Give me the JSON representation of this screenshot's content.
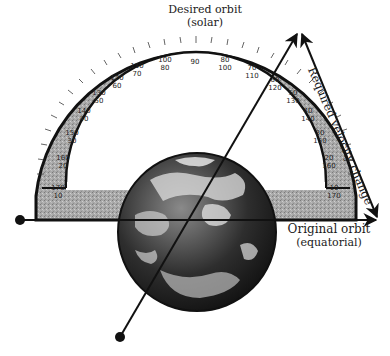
{
  "diagram": {
    "labels": {
      "desired_orbit": "Desired orbit",
      "desired_orbit_sub": "(solar)",
      "original_orbit": "Original orbit",
      "original_orbit_sub": "(equatorial)",
      "velocity_change": "Required velocity change"
    },
    "protractor": {
      "outer_scale": [
        "10",
        "20",
        "30",
        "40",
        "50",
        "60",
        "70",
        "80",
        "90",
        "100",
        "110",
        "120",
        "130",
        "140",
        "150",
        "160",
        "170"
      ],
      "inner_scale": [
        "170",
        "160",
        "150",
        "140",
        "130",
        "120",
        "110",
        "100",
        "90",
        "80",
        "70",
        "60",
        "50",
        "40",
        "30",
        "20",
        "10"
      ],
      "visible_pairs": [
        {
          "outer": "120",
          "inner": "60"
        },
        {
          "outer": "110",
          "inner": "70"
        },
        {
          "outer": "100",
          "inner": "80"
        },
        {
          "outer": "90",
          "inner": ""
        },
        {
          "outer": "80",
          "inner": "100"
        },
        {
          "outer": "70",
          "inner": "110"
        },
        {
          "outer": "60",
          "inner": "120"
        },
        {
          "outer": "50",
          "inner": "130"
        },
        {
          "outer": "40",
          "inner": "140"
        }
      ]
    },
    "elements": [
      {
        "name": "earth-globe",
        "type": "image"
      },
      {
        "name": "original-orbit-arrow",
        "direction": "horizontal-right"
      },
      {
        "name": "desired-orbit-arrow",
        "direction": "inclined-up-right"
      },
      {
        "name": "velocity-change-arrow",
        "direction": "double-headed"
      }
    ],
    "caption": "(caption text cropped at bottom edge)"
  }
}
